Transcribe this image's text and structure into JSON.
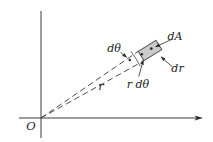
{
  "diagram": {
    "labels": {
      "origin": "O",
      "radius": "r",
      "dtheta": "dθ",
      "area_element": "dA",
      "radial_thickness": "dr",
      "arc_length": "r dθ"
    },
    "colors": {
      "line": "#3a3a3a",
      "element_fill": "#cbcbcb",
      "element_stroke": "#4a4a4a",
      "text": "#1c1c1c",
      "background": "#ffffff"
    }
  }
}
